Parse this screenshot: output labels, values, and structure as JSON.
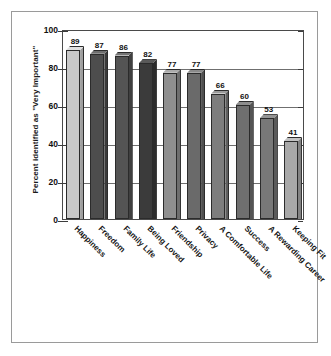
{
  "chart_data": {
    "type": "bar",
    "title": "",
    "xlabel": "",
    "ylabel": "Percent identified as \"Very Important\"",
    "ylim": [
      0,
      100
    ],
    "ytick_labels": [
      "100",
      "80",
      "60",
      "40",
      "20",
      "0"
    ],
    "ytick_values": [
      100,
      80,
      60,
      40,
      20,
      0
    ],
    "grid": true,
    "legend": "none",
    "categories": [
      "Happiness",
      "Freedom",
      "Family Life",
      "Being Loved",
      "Friendship",
      "Privacy",
      "A Comfortable Life",
      "Success",
      "A Rewarding Career",
      "Keeping Fit"
    ],
    "values": [
      89,
      87,
      86,
      82,
      77,
      77,
      66,
      60,
      53,
      41
    ],
    "value_labels": [
      "89",
      "87",
      "86",
      "82",
      "77",
      "77",
      "66",
      "60",
      "53",
      "41"
    ],
    "bar_colors": [
      "#c9c9c9",
      "#4d4d4d",
      "#545454",
      "#3b3b3b",
      "#8f8f8f",
      "#6a6a6a",
      "#7d7d7d",
      "#6f6f6f",
      "#787878",
      "#a8a8a8"
    ],
    "bar_side_colors": [
      "#9e9e9e",
      "#3a3a3a",
      "#404040",
      "#2c2c2c",
      "#6e6e6e",
      "#505050",
      "#5e5e5e",
      "#545454",
      "#5a5a5a",
      "#838383"
    ],
    "bar_top_colors": [
      "#e0e0e0",
      "#6e6e6e",
      "#757575",
      "#5a5a5a",
      "#ababab",
      "#8a8a8a",
      "#9a9a9a",
      "#8e8e8e",
      "#949494",
      "#c2c2c2"
    ]
  },
  "style": {
    "frame_color": "#9a9a9a",
    "axis_color": "#4a4a4a",
    "gridline_color": "#6f6f6f",
    "text_color": "#111111",
    "background": "#ffffff"
  }
}
